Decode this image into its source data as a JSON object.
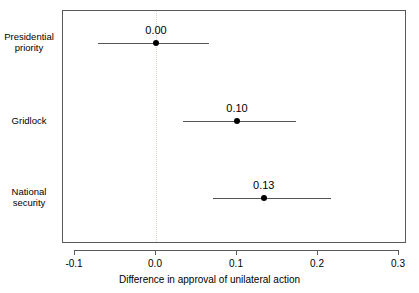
{
  "chart_data": {
    "type": "scatter",
    "title": "",
    "subtitle": "",
    "xlabel": "Difference in approval of unilateral action",
    "ylabel": "",
    "xlim": [
      -0.1,
      0.3
    ],
    "ylim": [
      0,
      3
    ],
    "grid": false,
    "legend": false,
    "zero_reference_line": 0.0,
    "categories": [
      "Presidential priority",
      "Gridlock",
      "National security"
    ],
    "xticks": [
      -0.1,
      0.0,
      0.1,
      0.2,
      0.3
    ],
    "xticklabels": [
      "-0.1",
      "0.0",
      "0.1",
      "0.2",
      "0.3"
    ],
    "points": [
      {
        "category": "Presidential priority",
        "label_line1": "Presidential",
        "label_line2": "priority",
        "estimate": 0.0,
        "estimate_label": "0.00",
        "ci_low": -0.072,
        "ci_high": 0.065
      },
      {
        "category": "Gridlock",
        "label_line1": "Gridlock",
        "label_line2": "",
        "estimate": 0.1,
        "estimate_label": "0.10",
        "ci_low": 0.033,
        "ci_high": 0.173
      },
      {
        "category": "National security",
        "label_line1": "National",
        "label_line2": "security",
        "estimate": 0.133,
        "estimate_label": "0.13",
        "ci_low": 0.07,
        "ci_high": 0.216
      }
    ],
    "colors": {
      "point": "#000000",
      "ci_line": "#555555",
      "frame": "#5a5a5a",
      "zero_line": "#d9d4c8",
      "background": "#ffffff"
    }
  }
}
